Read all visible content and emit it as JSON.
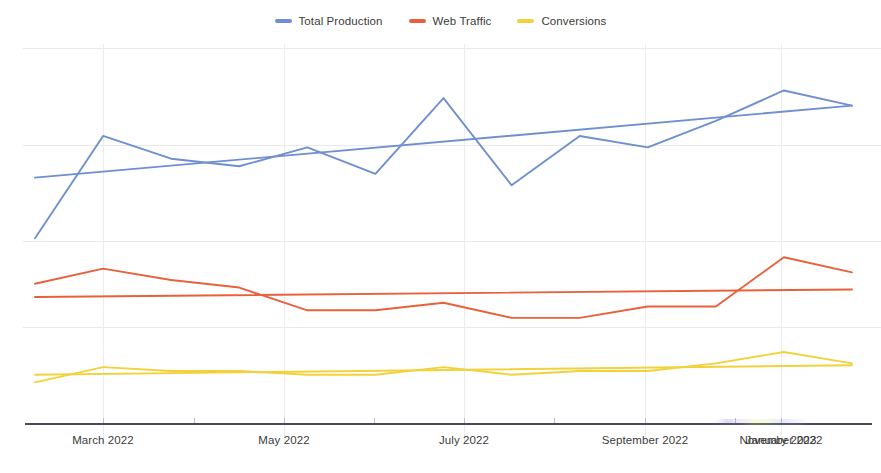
{
  "legend": {
    "position": "top-center",
    "items": [
      {
        "label": "Total Production",
        "color": "#6f8fd0",
        "icon": "line-swatch"
      },
      {
        "label": "Web Traffic",
        "color": "#e8603c",
        "icon": "line-swatch"
      },
      {
        "label": "Conversions",
        "color": "#f2d23b",
        "icon": "line-swatch"
      }
    ]
  },
  "axis": {
    "x_tick_labels": [
      "March 2022",
      "May 2022",
      "July 2022",
      "September 2022",
      "November 2022",
      "January 2023"
    ],
    "y_tick_labels": [],
    "axis_color": "#4a4a55",
    "grid_color": "#e9e9ef"
  },
  "chart_data": {
    "type": "line",
    "title": "",
    "subtitle": "",
    "xlabel": "",
    "ylabel": "",
    "grid": true,
    "legend_position": "top-center",
    "x": [
      "February 2022",
      "March 2022",
      "April 2022",
      "May 2022",
      "June 2022",
      "July 2022",
      "August 2022",
      "September 2022",
      "October 2022",
      "November 2022",
      "December 2022",
      "January 2023",
      "February 2023"
    ],
    "x_tick_labels": [
      "March 2022",
      "May 2022",
      "July 2022",
      "September 2022",
      "November 2022",
      "January 2023"
    ],
    "ylim": [
      0,
      100
    ],
    "xlim": [
      0,
      12
    ],
    "series": [
      {
        "name": "Total Production",
        "color": "#6f8fd0",
        "values": [
          49,
          76,
          70,
          68,
          73,
          66,
          86,
          63,
          76,
          73,
          80,
          88,
          84
        ],
        "trend": {
          "name": "Total Production trend",
          "start": 65,
          "end": 84
        }
      },
      {
        "name": "Web Traffic",
        "color": "#e8603c",
        "values": [
          37,
          41,
          38,
          36,
          30,
          30,
          32,
          28,
          28,
          31,
          31,
          44,
          40
        ],
        "trend": {
          "name": "Web Traffic trend",
          "start": 33.5,
          "end": 35.5
        }
      },
      {
        "name": "Conversions",
        "color": "#f2d23b",
        "values": [
          11,
          15,
          14,
          14,
          13,
          13,
          15,
          13,
          14,
          14,
          16,
          19,
          16
        ],
        "trend": {
          "name": "Conversions trend",
          "start": 13,
          "end": 15.5
        }
      }
    ]
  },
  "plot_geometry": {
    "left": 35,
    "right": 852,
    "top": 45,
    "bottom": 424,
    "y_gridlines": [
      48,
      145,
      241,
      327
    ],
    "x_gridlines": [
      103,
      284,
      464,
      645,
      781
    ],
    "tick_x": [
      103,
      194,
      284,
      374,
      464,
      554,
      645,
      735,
      781
    ],
    "label_x": [
      103,
      284,
      464,
      645,
      781,
      781
    ]
  }
}
